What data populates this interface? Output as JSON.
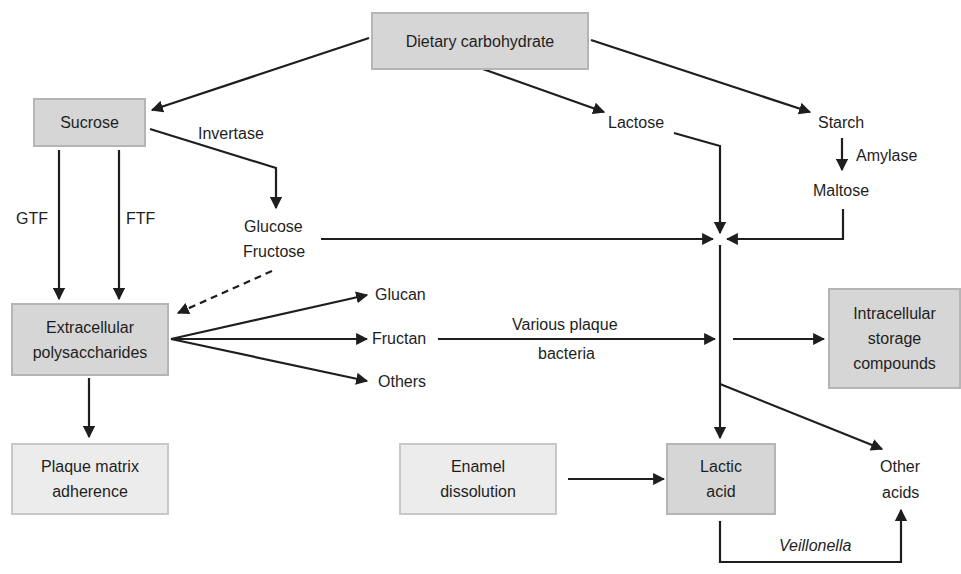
{
  "boxes": {
    "dietary": "Dietary carbohydrate",
    "sucrose": "Sucrose",
    "eps_line1": "Extracellular",
    "eps_line2": "polysaccharides",
    "plaque_line1": "Plaque matrix",
    "plaque_line2": "adherence",
    "enamel_line1": "Enamel",
    "enamel_line2": "dissolution",
    "lactic_line1": "Lactic",
    "lactic_line2": "acid",
    "intra_line1": "Intracellular",
    "intra_line2": "storage",
    "intra_line3": "compounds"
  },
  "labels": {
    "lactose": "Lactose",
    "starch": "Starch",
    "amylase": "Amylase",
    "maltose": "Maltose",
    "invertase": "Invertase",
    "glucose": "Glucose",
    "fructose": "Fructose",
    "gtf": "GTF",
    "ftf": "FTF",
    "glucan": "Glucan",
    "fructan": "Fructan",
    "others": "Others",
    "various_line1": "Various plaque",
    "various_line2": "bacteria",
    "other_acids_line1": "Other",
    "other_acids_line2": "acids",
    "veillonella": "Veillonella"
  },
  "colors": {
    "box_dark": "#d6d6d6",
    "box_light": "#ececec",
    "arrow": "#1e1e1e"
  }
}
